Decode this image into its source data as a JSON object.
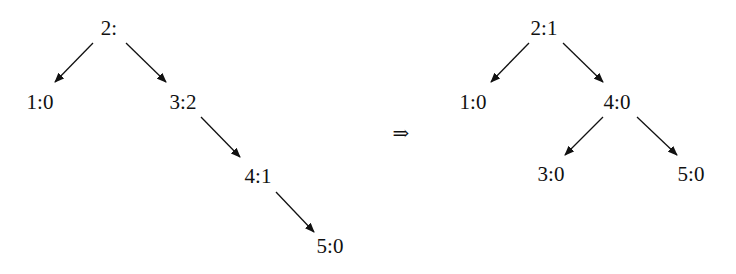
{
  "trees": {
    "before": {
      "nodes": [
        {
          "id": "n2",
          "label": "2:",
          "x": 109,
          "y": 28
        },
        {
          "id": "n1",
          "label": "1:0",
          "x": 40,
          "y": 102
        },
        {
          "id": "n3",
          "label": "3:2",
          "x": 183,
          "y": 102
        },
        {
          "id": "n4",
          "label": "4:1",
          "x": 258,
          "y": 176
        },
        {
          "id": "n5",
          "label": "5:0",
          "x": 330,
          "y": 246
        }
      ],
      "edges": [
        {
          "from": "2:",
          "to": "1:0",
          "x1": 93,
          "y1": 43,
          "x2": 55,
          "y2": 82
        },
        {
          "from": "2:",
          "to": "3:2",
          "x1": 126,
          "y1": 43,
          "x2": 166,
          "y2": 82
        },
        {
          "from": "3:2",
          "to": "4:1",
          "x1": 201,
          "y1": 117,
          "x2": 240,
          "y2": 157
        },
        {
          "from": "4:1",
          "to": "5:0",
          "x1": 276,
          "y1": 192,
          "x2": 314,
          "y2": 232
        }
      ]
    },
    "after": {
      "nodes": [
        {
          "id": "m2",
          "label": "2:1",
          "x": 544,
          "y": 28
        },
        {
          "id": "m1",
          "label": "1:0",
          "x": 473,
          "y": 102
        },
        {
          "id": "m4",
          "label": "4:0",
          "x": 617,
          "y": 102
        },
        {
          "id": "m3",
          "label": "3:0",
          "x": 551,
          "y": 174
        },
        {
          "id": "m5",
          "label": "5:0",
          "x": 691,
          "y": 174
        }
      ],
      "edges": [
        {
          "from": "2:1",
          "to": "1:0",
          "x1": 529,
          "y1": 43,
          "x2": 491,
          "y2": 82
        },
        {
          "from": "2:1",
          "to": "4:0",
          "x1": 563,
          "y1": 43,
          "x2": 603,
          "y2": 82
        },
        {
          "from": "4:0",
          "to": "3:0",
          "x1": 603,
          "y1": 117,
          "x2": 565,
          "y2": 155
        },
        {
          "from": "4:0",
          "to": "5:0",
          "x1": 637,
          "y1": 117,
          "x2": 677,
          "y2": 155
        }
      ]
    }
  },
  "transform_arrow": {
    "symbol": "⇒",
    "x": 401,
    "y": 133
  }
}
